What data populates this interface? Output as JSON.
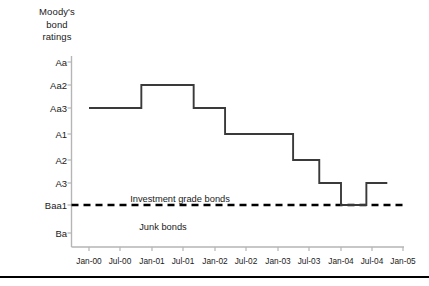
{
  "chart_data": {
    "type": "line",
    "title": "Moody's bond ratings",
    "xlabel": "",
    "ylabel": "Moody's bond ratings",
    "grid": false,
    "legend": null,
    "y_categories": [
      "Aa",
      "Aa2",
      "Aa3",
      "A1",
      "A2",
      "A3",
      "Baa1",
      "Ba"
    ],
    "x_tick_labels": [
      "Jan-00",
      "Jul-00",
      "Jan-01",
      "Jul-01",
      "Jan-02",
      "Jul-02",
      "Jan-03",
      "Jul-03",
      "Jan-04",
      "Jul-04",
      "Jan-05"
    ],
    "annotations": [
      {
        "text": "Investment grade bonds",
        "position": "above-threshold"
      },
      {
        "text": "Junk bonds",
        "position": "below-threshold"
      }
    ],
    "threshold": {
      "label": "Baa1",
      "style": "dashed",
      "color": "#000000"
    },
    "series": [
      {
        "name": "Moody's rating",
        "step": "post",
        "color": "#3a3a3a",
        "points": [
          {
            "x": "Jan-00",
            "rating": "Aa3"
          },
          {
            "x": "Jul-00",
            "rating": "Aa3"
          },
          {
            "x": "Nov-00",
            "rating": "Aa2"
          },
          {
            "x": "Jan-01",
            "rating": "Aa2"
          },
          {
            "x": "Jul-01",
            "rating": "Aa2"
          },
          {
            "x": "Sep-01",
            "rating": "Aa3"
          },
          {
            "x": "Jan-02",
            "rating": "Aa3"
          },
          {
            "x": "Mar-02",
            "rating": "A1"
          },
          {
            "x": "Jul-02",
            "rating": "A1"
          },
          {
            "x": "Jan-03",
            "rating": "A1"
          },
          {
            "x": "Apr-03",
            "rating": "A2"
          },
          {
            "x": "Jul-03",
            "rating": "A2"
          },
          {
            "x": "Sep-03",
            "rating": "A3"
          },
          {
            "x": "Dec-03",
            "rating": "A3"
          },
          {
            "x": "Jan-04",
            "rating": "Baa1"
          },
          {
            "x": "Apr-04",
            "rating": "Baa1"
          },
          {
            "x": "Jun-04",
            "rating": "A3"
          },
          {
            "x": "Oct-04",
            "rating": "A3"
          }
        ]
      }
    ]
  },
  "axis_title": {
    "line1": "Moody's",
    "line2": "bond",
    "line3": "ratings"
  },
  "y_ticks": [
    {
      "label": "Aa",
      "y": 62
    },
    {
      "label": "Aa2",
      "y": 85
    },
    {
      "label": "Aa3",
      "y": 108
    },
    {
      "label": "A1",
      "y": 134
    },
    {
      "label": "A2",
      "y": 160
    },
    {
      "label": "A3",
      "y": 183
    },
    {
      "label": "Baa1",
      "y": 205
    },
    {
      "label": "Ba",
      "y": 233
    }
  ],
  "x_ticks": [
    {
      "label": "Jan-00",
      "x": 89
    },
    {
      "label": "Jul-00",
      "x": 120
    },
    {
      "label": "Jan-01",
      "x": 152
    },
    {
      "label": "Jul-01",
      "x": 183
    },
    {
      "label": "Jan-02",
      "x": 215
    },
    {
      "label": "Jul-02",
      "x": 246
    },
    {
      "label": "Jan-03",
      "x": 278
    },
    {
      "label": "Jul-03",
      "x": 309
    },
    {
      "label": "Jan-04",
      "x": 341
    },
    {
      "label": "Jul-04",
      "x": 372
    },
    {
      "label": "Jan-05",
      "x": 403
    }
  ],
  "band_labels": [
    {
      "text": "Investment grade bonds",
      "x": 180,
      "y": 194
    },
    {
      "text": "Junk bonds",
      "x": 163,
      "y": 222
    }
  ],
  "colors": {
    "line": "#3a3a3a",
    "threshold": "#000000",
    "axis": "#b5b5b5",
    "text": "#1a1a1a",
    "background": "#ffffff"
  }
}
